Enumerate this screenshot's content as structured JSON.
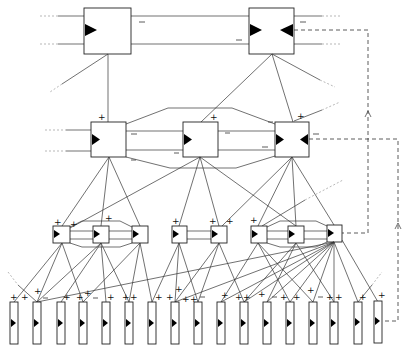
{
  "diagram": {
    "type": "hierarchical-network",
    "colors": {
      "line": "#333333",
      "box_fill": "#ffffff",
      "marker": "#000000"
    },
    "labels": {
      "excitatory": "+",
      "inhibitory": "−"
    },
    "layers": [
      {
        "name": "top",
        "boxes": [
          {
            "id": "T1",
            "x": 84,
            "y": 8,
            "w": 47,
            "h": 46,
            "markers": [
              "left"
            ]
          },
          {
            "id": "T2",
            "x": 249,
            "y": 8,
            "w": 45,
            "h": 46,
            "markers": [
              "left",
              "right"
            ]
          }
        ]
      },
      {
        "name": "layer2",
        "boxes": [
          {
            "id": "M1",
            "x": 91,
            "y": 122,
            "w": 35,
            "h": 35,
            "markers": [
              "left"
            ]
          },
          {
            "id": "M2",
            "x": 183,
            "y": 122,
            "w": 35,
            "h": 35,
            "markers": [
              "left"
            ]
          },
          {
            "id": "M3",
            "x": 275,
            "y": 122,
            "w": 34,
            "h": 35,
            "markers": [
              "left",
              "right"
            ]
          }
        ]
      },
      {
        "name": "layer3",
        "boxes": [
          {
            "id": "S1",
            "x": 53,
            "y": 226,
            "w": 17,
            "h": 17
          },
          {
            "id": "S2",
            "x": 93,
            "y": 226,
            "w": 16,
            "h": 17
          },
          {
            "id": "S3",
            "x": 132,
            "y": 226,
            "w": 16,
            "h": 17
          },
          {
            "id": "S4",
            "x": 172,
            "y": 226,
            "w": 15,
            "h": 17
          },
          {
            "id": "S5",
            "x": 211,
            "y": 226,
            "w": 16,
            "h": 17
          },
          {
            "id": "S6",
            "x": 251,
            "y": 226,
            "w": 16,
            "h": 17
          },
          {
            "id": "S7",
            "x": 288,
            "y": 226,
            "w": 16,
            "h": 17
          },
          {
            "id": "S8",
            "x": 327,
            "y": 225,
            "w": 15,
            "h": 17
          }
        ]
      },
      {
        "name": "bottom",
        "box_w": 8,
        "box_y": 302,
        "box_h": 42,
        "x": [
          10,
          33,
          57,
          79,
          102,
          125,
          148,
          171,
          194,
          217,
          241,
          263,
          286,
          310,
          331,
          355,
          374
        ]
      }
    ],
    "feedback_loops": [
      {
        "from": "T2",
        "to": "S8",
        "arrow": "up"
      },
      {
        "from": "M3",
        "to": "bottom-17",
        "arrow": "up"
      }
    ]
  }
}
